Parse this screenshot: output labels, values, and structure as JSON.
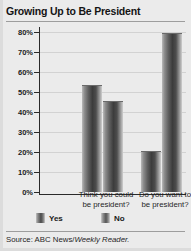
{
  "header": {
    "title": "Growing Up to Be President"
  },
  "source": {
    "prefix": "Source: ABC News/",
    "publication": "Weekly Reader."
  },
  "legend": [
    {
      "label": "Yes",
      "color": "#3c3c3c"
    },
    {
      "label": "No",
      "color": "#555555"
    }
  ],
  "axis": {
    "yticks": [
      "0%",
      "10%",
      "20%",
      "30%",
      "40%",
      "50%",
      "60%",
      "70%",
      "80%"
    ]
  },
  "categories": [
    {
      "line1": "Think you could",
      "line2": "be president?"
    },
    {
      "line1": "Do you want to",
      "line2": "be president?"
    }
  ],
  "chart_data": {
    "type": "bar",
    "title": "Growing Up to Be President",
    "xlabel": "",
    "ylabel": "",
    "ylim": [
      0,
      80
    ],
    "ytick_step": 10,
    "grid": true,
    "legend_position": "bottom",
    "categories": [
      "Think you could be president?",
      "Do you want to be president?"
    ],
    "series": [
      {
        "name": "Yes",
        "values": [
          53,
          20
        ]
      },
      {
        "name": "No",
        "values": [
          45,
          79
        ]
      }
    ],
    "source": "Source: ABC News/Weekly Reader."
  }
}
